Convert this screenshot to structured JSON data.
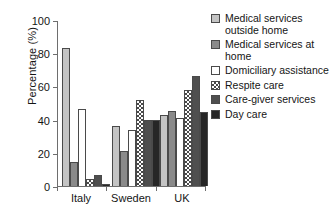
{
  "chart_data": {
    "type": "bar",
    "title": "",
    "xlabel": "",
    "ylabel": "Percentage (%)",
    "ylim": [
      0,
      100
    ],
    "yticks": [
      0,
      20,
      40,
      60,
      80,
      100
    ],
    "grid": false,
    "legend_position": "right",
    "categories": [
      "Italy",
      "Sweden",
      "UK"
    ],
    "series": [
      {
        "name": "Medical services outside home",
        "color": "#c4c4c4",
        "pattern": "solid",
        "values": [
          83,
          36,
          42.5
        ]
      },
      {
        "name": "Medical services at home",
        "color": "#8a8a8a",
        "pattern": "solid",
        "values": [
          14.5,
          21,
          45
        ]
      },
      {
        "name": "Domiciliary assistance",
        "color": "#ffffff",
        "pattern": "solid",
        "values": [
          46.5,
          33.5,
          41
        ]
      },
      {
        "name": "Respite care",
        "color": "#ffffff",
        "pattern": "checkered",
        "values": [
          4,
          52,
          58
        ]
      },
      {
        "name": "Care-giver services",
        "color": "#4f4f4f",
        "pattern": "solid",
        "values": [
          6.5,
          40,
          66.5
        ]
      },
      {
        "name": "Day care",
        "color": "#262626",
        "pattern": "solid",
        "values": [
          1.5,
          40,
          44.5
        ]
      }
    ]
  },
  "legend": {
    "items": [
      {
        "label": "Medical services outside home",
        "swatch": "legend-swatch-medical-outside"
      },
      {
        "label": "Medical services at home",
        "swatch": "legend-swatch-medical-at-home"
      },
      {
        "label": "Domiciliary assistance",
        "swatch": "legend-swatch-domiciliary"
      },
      {
        "label": "Respite care",
        "swatch": "legend-swatch-respite"
      },
      {
        "label": "Care-giver services",
        "swatch": "legend-swatch-caregiver"
      },
      {
        "label": "Day care",
        "swatch": "legend-swatch-day-care"
      }
    ]
  },
  "axis": {
    "y_title": "Percentage (%)",
    "y_tick_labels": [
      "0",
      "20",
      "40",
      "60",
      "80",
      "100"
    ],
    "x_tick_labels": [
      "Italy",
      "Sweden",
      "UK"
    ]
  }
}
